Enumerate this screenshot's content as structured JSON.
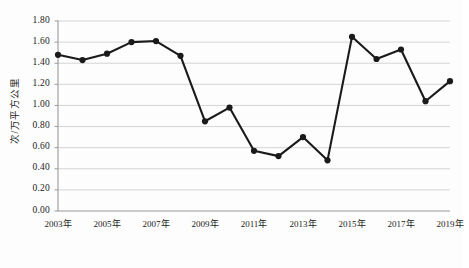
{
  "chart_data": {
    "type": "line",
    "title": "",
    "xlabel": "",
    "ylabel": "次/万平方公里",
    "ylim": [
      0.0,
      1.8
    ],
    "ytick_step": 0.2,
    "grid": true,
    "legend": false,
    "marker": "circle",
    "line_color": "#1a1a1a",
    "grid_color": "#d0d0d0",
    "axis_color": "#9a9a9a",
    "categories": [
      "2003年",
      "2004年",
      "2005年",
      "2006年",
      "2007年",
      "2008年",
      "2009年",
      "2010年",
      "2011年",
      "2012年",
      "2013年",
      "2014年",
      "2015年",
      "2016年",
      "2017年",
      "2018年",
      "2019年"
    ],
    "xtick_labels": [
      "2003年",
      "2005年",
      "2007年",
      "2009年",
      "2011年",
      "2013年",
      "2015年",
      "2017年",
      "2019年"
    ],
    "ytick_labels": [
      "1.80",
      "1.60",
      "1.40",
      "1.20",
      "1.00",
      "0.80",
      "0.60",
      "0.40",
      "0.20",
      "0.00"
    ],
    "ytick_values": [
      1.8,
      1.6,
      1.4,
      1.2,
      1.0,
      0.8,
      0.6,
      0.4,
      0.2,
      0.0
    ],
    "series": [
      {
        "name": "次/万平方公里",
        "values": [
          1.48,
          1.43,
          1.49,
          1.6,
          1.61,
          1.47,
          0.85,
          0.98,
          0.57,
          0.52,
          0.7,
          0.48,
          1.65,
          1.44,
          1.53,
          1.04,
          1.23
        ]
      }
    ]
  }
}
